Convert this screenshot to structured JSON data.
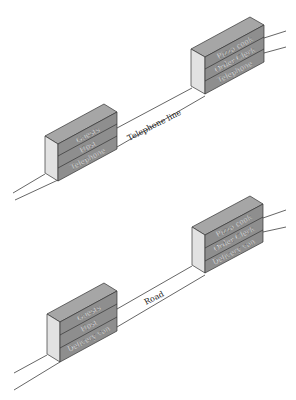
{
  "diagram": {
    "top": {
      "left_stack": {
        "layers": [
          "Guests",
          "Host",
          "Telephone"
        ]
      },
      "right_stack": {
        "layers": [
          "Pizza cook",
          "Order Clerk",
          "Telephone"
        ]
      },
      "link_label": "Telephone line"
    },
    "bottom": {
      "left_stack": {
        "layers": [
          "Guests",
          "Host",
          "Delivery van"
        ]
      },
      "right_stack": {
        "layers": [
          "Pizza cook",
          "Order Clerk",
          "Delivery van"
        ]
      },
      "link_label": "Road"
    },
    "colors": {
      "top_face": "#a6a6a6",
      "side_face": "#e2e2e2",
      "front_face": "#8e8e8e",
      "line": "#555555"
    }
  }
}
